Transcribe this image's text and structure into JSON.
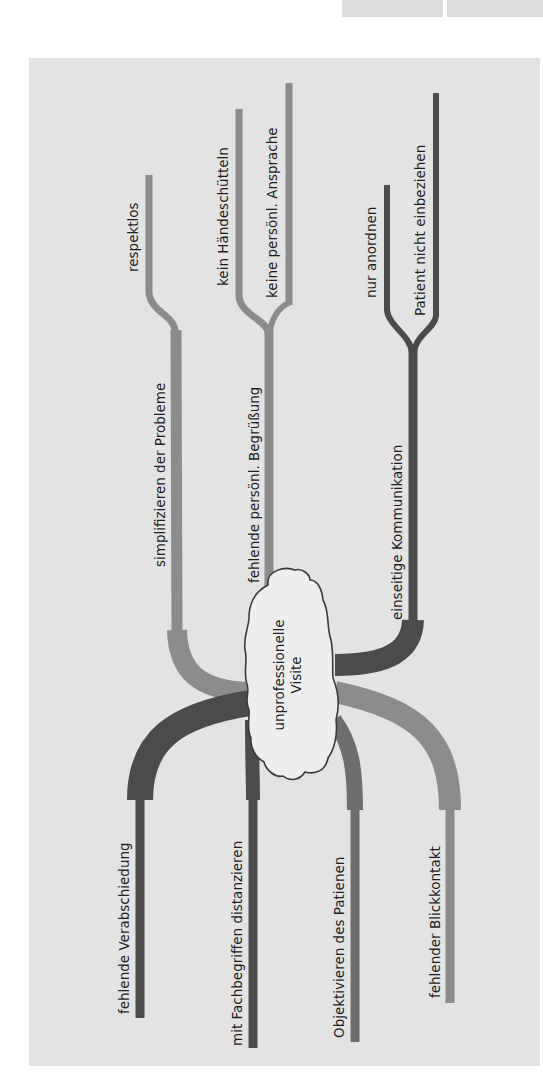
{
  "diagram": {
    "type": "mind-map",
    "center": {
      "line1": "unprofessionelle",
      "line2": "Visite"
    },
    "colors": {
      "background_panel": "#e3e3e3",
      "branch_light": "#8c8c8c",
      "branch_dark": "#4b4b4b",
      "branch_mid": "#6e6e6e",
      "cloud_fill": "#eeeeee"
    },
    "upper_branches": [
      {
        "label": "simplifizieren der Probleme",
        "tone": "light",
        "children": [
          {
            "label": "respektlos"
          }
        ]
      },
      {
        "label": "fehlende persönl. Begrüßung",
        "tone": "light",
        "children": [
          {
            "label": "kein Händeschütteln"
          },
          {
            "label": "keine persönl. Ansprache"
          }
        ]
      },
      {
        "label": "einseitige Kommunikation",
        "tone": "dark",
        "children": [
          {
            "label": "nur anordnen"
          },
          {
            "label": "Patient nicht einbeziehen"
          }
        ]
      }
    ],
    "lower_branches": [
      {
        "label": "fehlende Verabschiedung",
        "tone": "dark"
      },
      {
        "label": "mit Fachbegriffen distanzieren",
        "tone": "dark"
      },
      {
        "label": "Objektivieren des Patienen",
        "tone": "mid"
      },
      {
        "label": "fehlender Blickkontakt",
        "tone": "light"
      }
    ]
  }
}
